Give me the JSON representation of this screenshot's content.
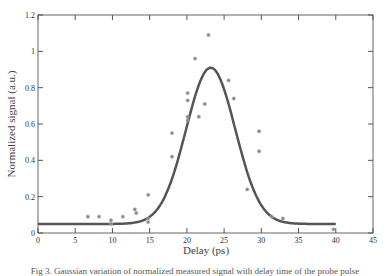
{
  "chart_data": {
    "type": "scatter",
    "title": "",
    "xlabel": "Delay (ps)",
    "ylabel": "Normalized signal (a.u.)",
    "xlim": [
      0,
      45
    ],
    "ylim": [
      0,
      1.2
    ],
    "xticks": [
      0,
      5,
      10,
      15,
      20,
      25,
      30,
      35,
      40,
      45
    ],
    "yticks": [
      0,
      0.2,
      0.4,
      0.6,
      0.8,
      1,
      1.2
    ],
    "xtick_labels": [
      "0",
      "5",
      "10",
      "15",
      "20",
      "25",
      "30",
      "35",
      "40",
      "45"
    ],
    "ytick_labels": [
      "0",
      "0.2",
      "0.4",
      "0.6",
      "0.8",
      "1",
      "1.2"
    ],
    "grid": false,
    "legend": "none",
    "series": [
      {
        "name": "measured",
        "kind": "scatter",
        "color": "#8a8a8a",
        "points": [
          [
            6.7,
            0.09
          ],
          [
            8.2,
            0.09
          ],
          [
            9.8,
            0.07
          ],
          [
            9.8,
            0.05
          ],
          [
            11.4,
            0.09
          ],
          [
            13.0,
            0.13
          ],
          [
            13.2,
            0.11
          ],
          [
            14.8,
            0.21
          ],
          [
            14.8,
            0.08
          ],
          [
            14.8,
            0.06
          ],
          [
            18.0,
            0.55
          ],
          [
            18.0,
            0.42
          ],
          [
            20.1,
            0.77
          ],
          [
            20.1,
            0.73
          ],
          [
            20.1,
            0.64
          ],
          [
            20.1,
            0.62
          ],
          [
            21.1,
            0.96
          ],
          [
            21.6,
            0.64
          ],
          [
            22.4,
            0.71
          ],
          [
            22.9,
            1.09
          ],
          [
            25.6,
            0.84
          ],
          [
            26.3,
            0.74
          ],
          [
            28.1,
            0.24
          ],
          [
            29.7,
            0.56
          ],
          [
            29.7,
            0.45
          ],
          [
            31.4,
            0.09
          ],
          [
            32.9,
            0.08
          ],
          [
            39.7,
            0.02
          ]
        ]
      },
      {
        "name": "gaussian-fit",
        "kind": "line",
        "color": "#555555",
        "model": {
          "baseline": 0.05,
          "amplitude": 0.86,
          "center": 23.2,
          "sigma": 3.3
        },
        "x_range": [
          0,
          40
        ]
      }
    ]
  },
  "caption": "Fig 3. Gaussian variation of normalized measured signal with delay time of the probe pulse"
}
